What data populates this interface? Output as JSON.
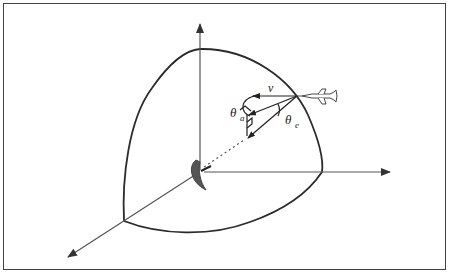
{
  "diagram": {
    "type": "radar-geometry",
    "labels": {
      "velocity": "v",
      "azimuth": "θ",
      "azimuth_sub": "a",
      "elevation": "θ",
      "elevation_sub": "e"
    },
    "icons": {
      "aircraft": "aircraft-icon",
      "radar_dish": "radar-dish-icon"
    },
    "colors": {
      "line": "#2a2a2a",
      "axis": "#555555",
      "dish": "#555555",
      "border": "#444444"
    }
  }
}
